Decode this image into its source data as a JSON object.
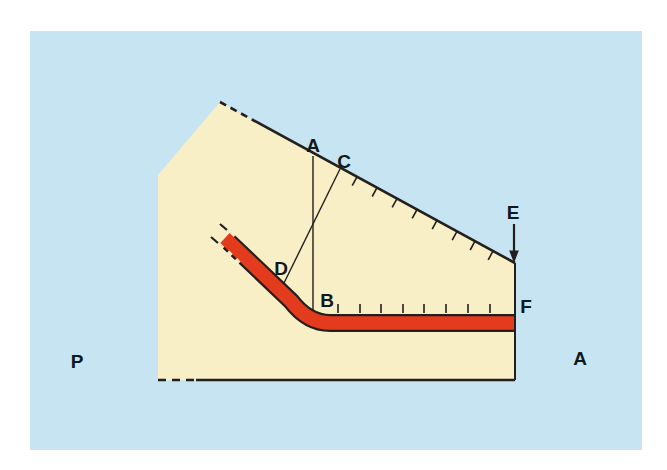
{
  "diagram": {
    "description_labels": {
      "a_top": "A",
      "c": "C",
      "e": "E",
      "f": "F",
      "b": "B",
      "d": "D",
      "p": "P",
      "a_right": "A"
    },
    "colors": {
      "page_bg": "#ffffff",
      "sky": "#c6e4f1",
      "land": "#f9efc7",
      "seam_red": "#e43a1d",
      "line": "#231f1c",
      "label": "#10181f"
    }
  }
}
